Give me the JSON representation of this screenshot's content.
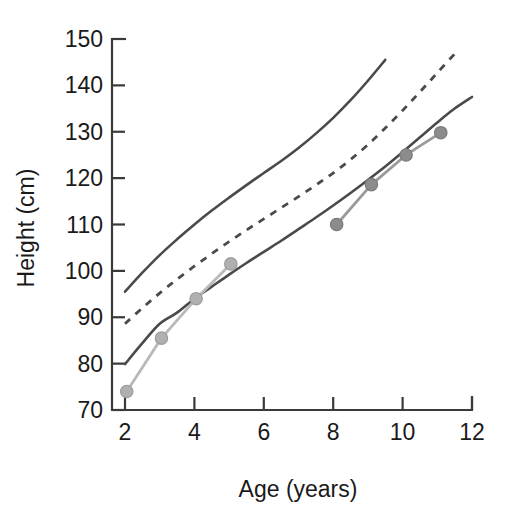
{
  "chart_data": {
    "type": "line",
    "title": "",
    "subtitle": "",
    "xlabel": "Age (years)",
    "ylabel": "Height (cm)",
    "xlim": [
      2,
      12
    ],
    "ylim": [
      70,
      150
    ],
    "xticks": [
      2,
      4,
      6,
      8,
      10,
      12
    ],
    "xtick_labels": [
      "2",
      "4",
      "6",
      "8",
      "10",
      "12"
    ],
    "yticks": [
      70,
      80,
      90,
      100,
      110,
      120,
      130,
      140,
      150
    ],
    "ytick_labels": [
      "70",
      "80",
      "90",
      "100",
      "110",
      "120",
      "130",
      "140",
      "150"
    ],
    "grid": false,
    "legend": "none",
    "legend_position": "none",
    "annotations": [],
    "series": [
      {
        "name": "Upper reference centile",
        "style": "solid",
        "color": "#4a4a4a",
        "markers": false,
        "x": [
          2.0,
          2.5,
          3.0,
          3.5,
          4.0,
          4.5,
          5.0,
          5.5,
          6.0,
          6.5,
          7.0,
          7.5,
          8.0,
          8.5,
          9.0,
          9.5
        ],
        "y": [
          95.5,
          99.6,
          103.4,
          106.8,
          110.0,
          113.0,
          115.8,
          118.5,
          121.1,
          123.7,
          126.5,
          129.6,
          133.0,
          136.8,
          141.0,
          145.5
        ]
      },
      {
        "name": "Median reference centile",
        "style": "dashed",
        "color": "#4a4a4a",
        "markers": false,
        "x": [
          2.0,
          2.5,
          3.0,
          3.5,
          4.0,
          4.5,
          5.0,
          5.5,
          6.0,
          6.5,
          7.0,
          7.5,
          8.0,
          8.5,
          9.0,
          9.5,
          10.0,
          10.5,
          11.0,
          11.5
        ],
        "y": [
          88.6,
          92.0,
          95.2,
          98.2,
          101.0,
          103.7,
          106.3,
          108.8,
          111.2,
          113.6,
          116.0,
          118.5,
          121.1,
          124.0,
          127.2,
          130.8,
          134.6,
          138.6,
          142.7,
          146.8
        ]
      },
      {
        "name": "Lower reference centile",
        "style": "solid",
        "color": "#4a4a4a",
        "markers": false,
        "x": [
          2.0,
          2.5,
          3.0,
          3.5,
          4.0,
          4.5,
          5.0,
          5.5,
          6.0,
          6.5,
          7.0,
          7.5,
          8.0,
          8.5,
          9.0,
          9.5,
          10.0,
          10.5,
          11.0,
          11.5,
          12.0
        ],
        "y": [
          79.9,
          84.4,
          88.6,
          91.0,
          94.0,
          96.6,
          99.2,
          101.7,
          104.1,
          106.5,
          109.0,
          111.5,
          114.1,
          116.8,
          119.6,
          122.5,
          125.6,
          128.8,
          132.0,
          135.0,
          137.5
        ]
      },
      {
        "name": "Patient measurements (early)",
        "style": "solid-markers",
        "color": "#b0b0b0",
        "markers": true,
        "x": [
          2.05,
          3.05,
          4.05,
          5.05
        ],
        "y": [
          74.0,
          85.5,
          94.0,
          101.5
        ]
      },
      {
        "name": "Patient measurements (late)",
        "style": "solid-markers",
        "color": "#8c8c8c",
        "markers": true,
        "x": [
          8.1,
          9.1,
          10.1,
          11.1
        ],
        "y": [
          110.0,
          118.6,
          125.0,
          129.8
        ]
      }
    ]
  },
  "axes": {
    "x_axis_title": "Age (years)",
    "y_axis_title": "Height (cm)"
  }
}
